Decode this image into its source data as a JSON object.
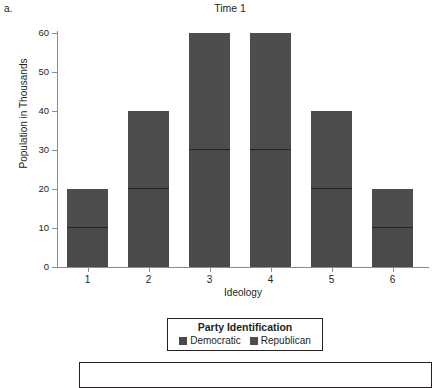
{
  "panel": {
    "label": "a."
  },
  "chart_data": {
    "type": "bar",
    "subtype": "stacked",
    "title": "Time 1",
    "xlabel": "Ideology",
    "ylabel": "Population in Thousands",
    "categories": [
      "1",
      "2",
      "3",
      "4",
      "5",
      "6"
    ],
    "series": [
      {
        "name": "Democratic",
        "values": [
          10,
          20,
          30,
          30,
          20,
          10
        ],
        "color": "#4a4a4a"
      },
      {
        "name": "Republican",
        "values": [
          10,
          20,
          30,
          30,
          20,
          10
        ],
        "color": "#4d4d4d"
      }
    ],
    "totals": [
      20,
      40,
      60,
      60,
      40,
      20
    ],
    "ylim": [
      0,
      60
    ],
    "yticks": [
      0,
      10,
      20,
      30,
      40,
      50,
      60
    ],
    "ytick_labels": [
      "0",
      "10",
      "20",
      "30",
      "40",
      "50",
      "60"
    ],
    "grid": false,
    "legend_position": "below-axis",
    "legend_title": "Party Identification"
  },
  "legend": {
    "title": "Party Identification",
    "entries": [
      {
        "label": "Democratic",
        "color": "#4a4a4a"
      },
      {
        "label": "Republican",
        "color": "#4d4d4d"
      }
    ]
  },
  "footer": {
    "text": ""
  }
}
